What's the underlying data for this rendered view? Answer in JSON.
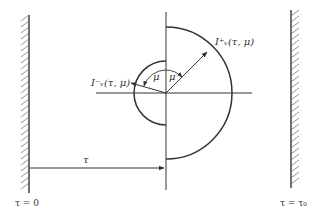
{
  "diagram": {
    "left_boundary_label": "τ = 0",
    "right_boundary_label": "τ = τ₀",
    "depth_arrow_label": "τ",
    "outward_intensity_label": "I⁺ᵥ(τ, μ)",
    "inward_intensity_label": "I⁻ᵥ(τ, μ)",
    "outward_angle_label": "μ",
    "inward_angle_label": "μ",
    "colors": {
      "ink": "#333333",
      "background": "#ffffff"
    }
  }
}
